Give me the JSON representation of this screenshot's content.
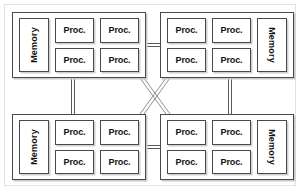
{
  "diagram": {
    "type": "network-topology",
    "colors": {
      "background": "#ffffff",
      "box_border": "#4a4a4a",
      "box_shadow": "#c9c9c9",
      "link_line": "#5a5a5a",
      "outer_frame": "#e2e2e2",
      "text": "#111111"
    },
    "nodes": [
      {
        "id": "top-left",
        "memory_label": "Memory",
        "memory_side": "left",
        "memory_text_rotation": "-90",
        "processors": [
          "Proc.",
          "Proc.",
          "Proc.",
          "Proc."
        ]
      },
      {
        "id": "top-right",
        "memory_label": "Memory",
        "memory_side": "right",
        "memory_text_rotation": "90",
        "processors": [
          "Proc.",
          "Proc.",
          "Proc.",
          "Proc."
        ]
      },
      {
        "id": "bottom-left",
        "memory_label": "Memory",
        "memory_side": "left",
        "memory_text_rotation": "-90",
        "processors": [
          "Proc.",
          "Proc.",
          "Proc.",
          "Proc."
        ]
      },
      {
        "id": "bottom-right",
        "memory_label": "Memory",
        "memory_side": "right",
        "memory_text_rotation": "90",
        "processors": [
          "Proc.",
          "Proc.",
          "Proc.",
          "Proc."
        ]
      }
    ],
    "links": [
      {
        "id": "link-top-horizontal",
        "from": "top-left",
        "to": "top-right",
        "style": "double-line",
        "orientation": "horizontal"
      },
      {
        "id": "link-bottom-horizontal",
        "from": "bottom-left",
        "to": "bottom-right",
        "style": "double-line",
        "orientation": "horizontal"
      },
      {
        "id": "link-left-vertical",
        "from": "top-left",
        "to": "bottom-left",
        "style": "double-line",
        "orientation": "vertical"
      },
      {
        "id": "link-right-vertical",
        "from": "top-right",
        "to": "bottom-right",
        "style": "double-line",
        "orientation": "vertical"
      },
      {
        "id": "link-diagonal-nwse",
        "from": "top-left",
        "to": "bottom-right",
        "style": "double-line",
        "orientation": "diagonal"
      },
      {
        "id": "link-diagonal-nesw",
        "from": "top-right",
        "to": "bottom-left",
        "style": "double-line",
        "orientation": "diagonal"
      }
    ]
  }
}
